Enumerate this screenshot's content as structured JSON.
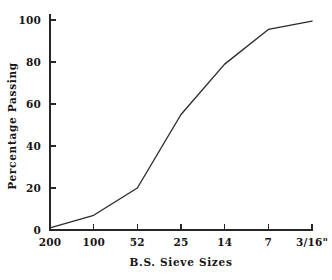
{
  "chart_data": {
    "type": "line",
    "title": "",
    "xlabel": "B.S. Sieve Sizes",
    "ylabel": "Percentage Passing",
    "categories": [
      "200",
      "100",
      "52",
      "25",
      "14",
      "7",
      "3/16\""
    ],
    "values": [
      1,
      7,
      20,
      55,
      79,
      95.5,
      99.5
    ],
    "series": [
      {
        "name": "Grading curve",
        "values": [
          1,
          7,
          20,
          55,
          79,
          95.5,
          99.5
        ],
        "color": "#2b2b2b"
      }
    ],
    "xtick_labels": [
      "200",
      "100",
      "52",
      "25",
      "14",
      "7",
      "3/16\""
    ],
    "ytick_labels": [
      "0",
      "20",
      "40",
      "60",
      "80",
      "100"
    ],
    "ytick_values": [
      0,
      20,
      40,
      60,
      80,
      100
    ],
    "ylim": [
      0,
      105
    ],
    "grid": false,
    "legend": false,
    "legend_position": "none",
    "axis_color": "#262626",
    "background": "#ffffff"
  },
  "axes": {
    "y_title": "Percentage Passing",
    "x_title": "B.S. Sieve Sizes"
  }
}
